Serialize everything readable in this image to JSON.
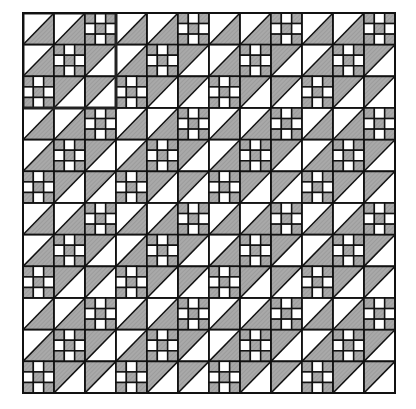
{
  "diagram": {
    "title": "",
    "grid": {
      "cols": 12,
      "rows": 12,
      "origin_x": 22,
      "origin_y": 12,
      "cell_w": 31,
      "cell_h": 31.67
    },
    "block": {
      "size": 3,
      "layout": [
        [
          "triA",
          "triA",
          "nine"
        ],
        [
          "triA",
          "nine",
          "triB"
        ],
        [
          "nine",
          "triB",
          "triB"
        ]
      ]
    },
    "nine_patch": [
      [
        1,
        0,
        1
      ],
      [
        0,
        1,
        0
      ],
      [
        1,
        0,
        1
      ]
    ],
    "highlight": {
      "col": 0,
      "row": 0,
      "cols": 3,
      "rows": 3
    },
    "colors": {
      "gray": "#a9a9a9",
      "white": "#ffffff",
      "line": "#111111",
      "background": "#ffffff"
    }
  }
}
